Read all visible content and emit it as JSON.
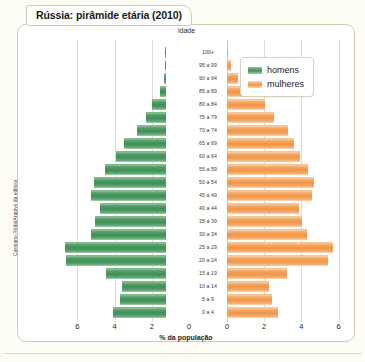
{
  "title": "Rússia: pirâmide etária (2010)",
  "credit": "Cassiano Röda/Arquivo da editora",
  "axis": {
    "age_caption": "idade",
    "x_title": "% da população",
    "x_ticks_left": [
      "6",
      "4",
      "2",
      "0"
    ],
    "x_ticks_right": [
      "0",
      "2",
      "4",
      "6"
    ],
    "x_max": 7.2
  },
  "legend": {
    "items": [
      {
        "label": "homens",
        "color": "#3f8f56",
        "key": "men"
      },
      {
        "label": "mulheres",
        "color": "#ef9447",
        "key": "women"
      }
    ]
  },
  "chart_data": {
    "type": "bar",
    "subtype": "population-pyramid",
    "title": "Rússia: pirâmide etária (2010)",
    "xlabel": "% da população",
    "ylabel": "idade",
    "xlim": [
      0,
      7.2
    ],
    "grid": true,
    "legend_position": "top-right",
    "categories": [
      "100+",
      "95 a 99",
      "90 a 94",
      "85 a 89",
      "80 a 84",
      "75 a 79",
      "70 a 74",
      "65 a 69",
      "60 a 64",
      "55 a 59",
      "50 a 54",
      "45 a 49",
      "40 a 44",
      "35 a 39",
      "30 a 34",
      "25 a 29",
      "20 a 24",
      "15 a 19",
      "10 a 14",
      "5 a 9",
      "0 a 4"
    ],
    "series": [
      {
        "name": "homens",
        "color": "#3f8f56",
        "side": "left",
        "values": [
          0.02,
          0.05,
          0.12,
          0.35,
          0.75,
          1.05,
          1.55,
          2.25,
          2.7,
          3.3,
          3.85,
          4.05,
          3.55,
          3.8,
          4.05,
          5.45,
          5.4,
          3.25,
          2.35,
          2.5,
          2.85
        ]
      },
      {
        "name": "mulheres",
        "color": "#ef9447",
        "side": "right",
        "values": [
          0.05,
          0.2,
          0.6,
          1.25,
          2.05,
          2.55,
          3.3,
          3.6,
          3.95,
          4.35,
          4.7,
          4.55,
          3.85,
          4.05,
          4.3,
          5.7,
          5.45,
          3.2,
          2.25,
          2.4,
          2.75
        ]
      }
    ]
  }
}
